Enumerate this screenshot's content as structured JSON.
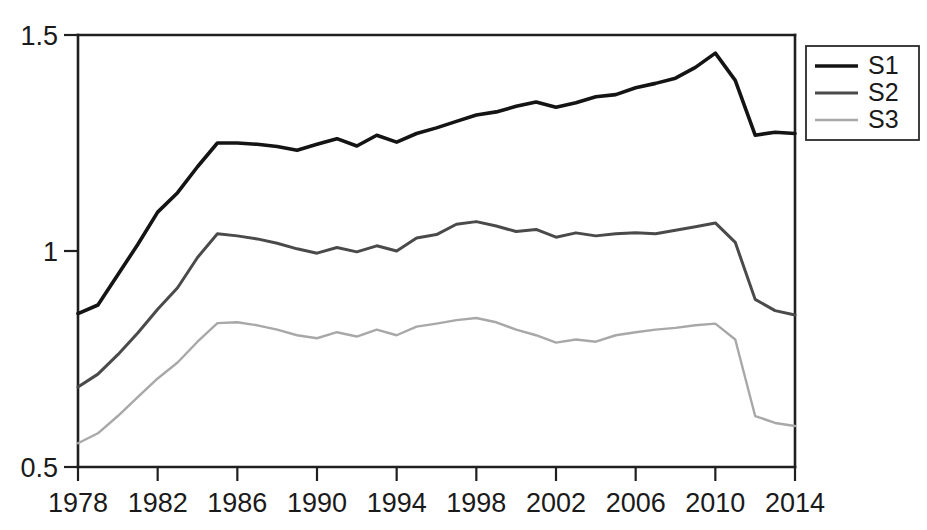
{
  "chart_data": {
    "type": "line",
    "title": "",
    "subtitle": "",
    "xlabel": "",
    "ylabel": "",
    "xlim": [
      1978,
      2014
    ],
    "ylim": [
      0.5,
      1.5
    ],
    "grid": false,
    "legend_position": "right-top",
    "x": [
      1978,
      1979,
      1980,
      1981,
      1982,
      1983,
      1984,
      1985,
      1986,
      1987,
      1988,
      1989,
      1990,
      1991,
      1992,
      1993,
      1994,
      1995,
      1996,
      1997,
      1998,
      1999,
      2000,
      2001,
      2002,
      2003,
      2004,
      2005,
      2006,
      2007,
      2008,
      2009,
      2010,
      2011,
      2012,
      2013,
      2014
    ],
    "x_tick_labels": [
      "1978",
      "1982",
      "1986",
      "1990",
      "1994",
      "1998",
      "2002",
      "2006",
      "2010",
      "2014"
    ],
    "x_ticks": [
      1978,
      1982,
      1986,
      1990,
      1994,
      1998,
      2002,
      2006,
      2010,
      2014
    ],
    "y_tick_labels": [
      "0.5",
      "1",
      "1.5"
    ],
    "y_ticks": [
      0.5,
      1,
      1.5
    ],
    "series": [
      {
        "name": "S1",
        "color": "#141414",
        "width": 3.6,
        "values": [
          0.855,
          0.875,
          0.945,
          1.015,
          1.09,
          1.135,
          1.195,
          1.25,
          1.25,
          1.247,
          1.242,
          1.233,
          1.247,
          1.26,
          1.243,
          1.268,
          1.252,
          1.272,
          1.285,
          1.3,
          1.315,
          1.322,
          1.335,
          1.345,
          1.333,
          1.343,
          1.357,
          1.362,
          1.378,
          1.388,
          1.4,
          1.425,
          1.458,
          1.395,
          1.268,
          1.275,
          1.272
        ]
      },
      {
        "name": "S2",
        "color": "#4a4a4a",
        "width": 3.0,
        "values": [
          0.685,
          0.715,
          0.76,
          0.81,
          0.865,
          0.915,
          0.985,
          1.04,
          1.035,
          1.028,
          1.018,
          1.005,
          0.995,
          1.008,
          0.998,
          1.012,
          1.0,
          1.03,
          1.038,
          1.062,
          1.068,
          1.058,
          1.045,
          1.05,
          1.032,
          1.042,
          1.035,
          1.04,
          1.042,
          1.04,
          1.048,
          1.056,
          1.065,
          1.02,
          0.888,
          0.862,
          0.852
        ]
      },
      {
        "name": "S3",
        "color": "#a8a8a8",
        "width": 2.4,
        "values": [
          0.555,
          0.578,
          0.618,
          0.662,
          0.705,
          0.742,
          0.79,
          0.833,
          0.835,
          0.828,
          0.818,
          0.805,
          0.798,
          0.812,
          0.802,
          0.818,
          0.805,
          0.825,
          0.832,
          0.84,
          0.845,
          0.835,
          0.818,
          0.805,
          0.788,
          0.795,
          0.79,
          0.805,
          0.812,
          0.818,
          0.822,
          0.828,
          0.832,
          0.795,
          0.618,
          0.602,
          0.595
        ]
      }
    ]
  },
  "legend": {
    "entries": [
      {
        "label": "S1"
      },
      {
        "label": "S2"
      },
      {
        "label": "S3"
      }
    ]
  }
}
